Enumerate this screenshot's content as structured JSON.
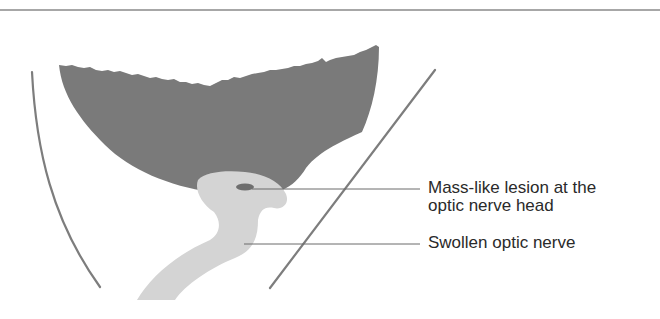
{
  "diagram": {
    "type": "anatomical-illustration",
    "colors": {
      "background": "#ffffff",
      "top_rule": "#8a8a8a",
      "globe_mass": "#7a7a7a",
      "optic_nerve": "#d4d4d4",
      "lesion": "#6e6e6e",
      "outline_lines": "#7d7d7d",
      "leader_lines": "#6a6a6a",
      "label_text": "#2a2a2a"
    },
    "labels": [
      {
        "id": "lesion",
        "lines": [
          "Mass-like lesion at the",
          "optic nerve head"
        ]
      },
      {
        "id": "nerve",
        "lines": [
          "Swollen optic nerve"
        ]
      }
    ]
  }
}
